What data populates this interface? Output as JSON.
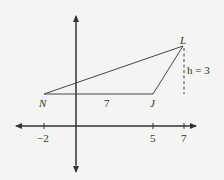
{
  "diagram": {
    "type": "coordinate-geometry",
    "axes": {
      "x_ticks": [
        {
          "value": "-2",
          "label": "−2"
        },
        {
          "value": "5",
          "label": "5"
        },
        {
          "value": "7",
          "label": "7"
        }
      ]
    },
    "points": {
      "N": {
        "label": "N"
      },
      "J": {
        "label": "J"
      },
      "L": {
        "label": "L"
      }
    },
    "segment_label": "7",
    "height_label": "h = 3"
  }
}
